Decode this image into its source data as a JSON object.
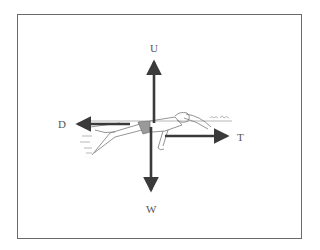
{
  "figure": {
    "forces": [
      {
        "key": "up",
        "label": "U"
      },
      {
        "key": "weight",
        "label": "W"
      },
      {
        "key": "drag",
        "label": "D"
      },
      {
        "key": "thrust",
        "label": "T"
      }
    ],
    "colors": {
      "arrow": "#3a3a3a",
      "frame": "#6a6a6a",
      "sketch": "#8a8a8a"
    }
  }
}
